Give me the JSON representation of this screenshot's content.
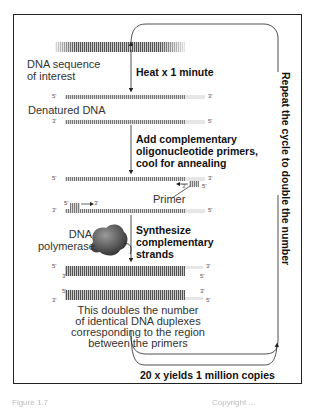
{
  "diagram": {
    "labels": {
      "dna_sequence": [
        "DNA sequence",
        "of interest"
      ],
      "denatured": "Denatured DNA",
      "primer": "Primer",
      "polymerase": [
        "DNA",
        "polymerase"
      ],
      "result": [
        "This doubles the number",
        "of identical DNA duplexes",
        "corresponding to the region",
        "between the primers"
      ]
    },
    "steps": {
      "heat": "Heat x 1 minute",
      "anneal": [
        "Add complementary",
        "oligonucleotide primers,",
        "cool for  annealing"
      ],
      "synthesize": [
        "Synthesize",
        "complementary",
        "strands"
      ],
      "repeat": "Repeat the cycle to double the number",
      "yield": "20 x yields 1 million copies"
    },
    "ends": {
      "five": "5'",
      "three": "3'"
    },
    "caption": {
      "left": "Figure 1.7",
      "right": "Copyright ..."
    }
  }
}
